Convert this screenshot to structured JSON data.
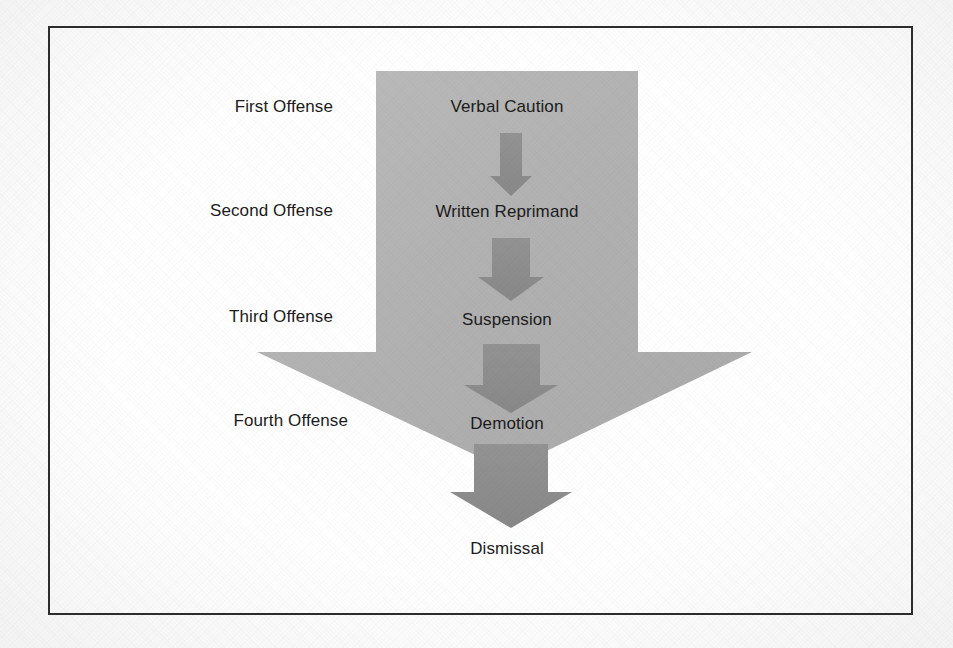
{
  "diagram": {
    "type": "process-flow-arrow",
    "background_color": "#ffffff",
    "frame_color": "#2e2e2e",
    "big_arrow_color": "#b2b2b2",
    "step_arrow_color": "#8c8c8c",
    "text_color": "#1c1c1c"
  },
  "offense_labels": [
    {
      "id": "first",
      "text": "First Offense",
      "x": 333,
      "y": 107
    },
    {
      "id": "second",
      "text": "Second Offense",
      "x": 333,
      "y": 211
    },
    {
      "id": "third",
      "text": "Third Offense",
      "x": 333,
      "y": 317
    },
    {
      "id": "fourth",
      "text": "Fourth Offense",
      "x": 348,
      "y": 421
    }
  ],
  "action_labels": [
    {
      "id": "verbal-caution",
      "text": "Verbal Caution",
      "x": 507,
      "y": 107
    },
    {
      "id": "written-reprimand",
      "text": "Written Reprimand",
      "x": 507,
      "y": 212
    },
    {
      "id": "suspension",
      "text": "Suspension",
      "x": 507,
      "y": 320
    },
    {
      "id": "demotion",
      "text": "Demotion",
      "x": 507,
      "y": 424
    },
    {
      "id": "dismissal",
      "text": "Dismissal",
      "x": 507,
      "y": 549
    }
  ],
  "step_arrows": [
    {
      "id": "arrow-1",
      "from": "verbal-caution",
      "to": "written-reprimand"
    },
    {
      "id": "arrow-2",
      "from": "written-reprimand",
      "to": "suspension"
    },
    {
      "id": "arrow-3",
      "from": "suspension",
      "to": "demotion"
    },
    {
      "id": "arrow-4",
      "from": "demotion",
      "to": "dismissal"
    }
  ]
}
